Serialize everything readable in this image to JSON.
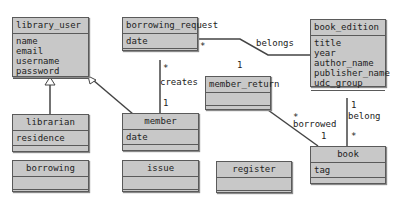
{
  "classes": {
    "library_user": {
      "name": "library_user",
      "attrs": [
        "name",
        "email",
        "username",
        "password"
      ]
    },
    "borrowing_request": {
      "name": "borrowing_request",
      "attrs": [
        "date"
      ]
    },
    "book_edition": {
      "name": "book_edition",
      "attrs": [
        "title",
        "year",
        "author_name",
        "publisher_name",
        "udc_group"
      ]
    },
    "member_return": {
      "name": "member_return",
      "attrs": []
    },
    "librarian": {
      "name": "librarian",
      "attrs": [
        "residence"
      ]
    },
    "member": {
      "name": "member",
      "attrs": [
        "date"
      ]
    },
    "book": {
      "name": "book",
      "attrs": [
        "tag"
      ]
    },
    "borrowing": {
      "name": "borrowing",
      "attrs": []
    },
    "issue": {
      "name": "issue",
      "attrs": []
    },
    "register": {
      "name": "register",
      "attrs": []
    }
  },
  "associations": {
    "belongs": {
      "label": "belongs",
      "src_mult": "*",
      "dst_mult": "1"
    },
    "creates": {
      "label": "creates",
      "src_mult": "*",
      "dst_mult": "1"
    },
    "borrowed": {
      "label": "borrowed",
      "src_mult": "*",
      "dst_mult": "1"
    },
    "belong": {
      "label": "belong",
      "src_mult": "1",
      "dst_mult": "*"
    }
  }
}
